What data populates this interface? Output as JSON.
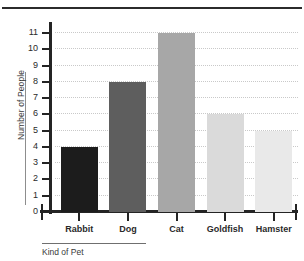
{
  "page": {
    "top_rule": "horizontal-rule"
  },
  "chart_data": {
    "type": "bar",
    "title": "",
    "subtitle": "",
    "categories": [
      "Rabbit",
      "Dog",
      "Cat",
      "Goldfish",
      "Hamster"
    ],
    "values": [
      4,
      8,
      11,
      6,
      5
    ],
    "series": [
      {
        "name": "Number of People",
        "values": [
          4,
          8,
          11,
          6,
          5
        ]
      }
    ],
    "xlabel": "Kind of Pet",
    "ylabel": "Number of People",
    "ylim": [
      0,
      11
    ],
    "ytick_labels": [
      "0",
      "1",
      "2",
      "3",
      "4",
      "5",
      "6",
      "7",
      "8",
      "9",
      "10",
      "11"
    ],
    "ytick_values": [
      0,
      1,
      2,
      3,
      4,
      5,
      6,
      7,
      8,
      9,
      10,
      11
    ],
    "grid": "horizontal-dotted",
    "legend": "none",
    "bar_colors": [
      "#1c1c1c",
      "#5e5e5e",
      "#a7a7a7",
      "#dadada",
      "#e9e9e9"
    ],
    "axis_color": "#242424",
    "gridline_color": "#c9c9c9"
  }
}
